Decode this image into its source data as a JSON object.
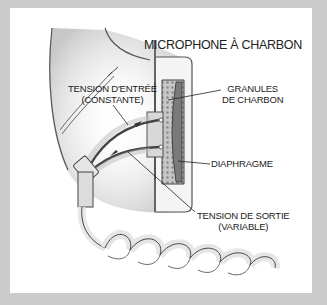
{
  "diagram": {
    "title": "MICROPHONE À CHARBON",
    "labels": {
      "input_voltage": {
        "line1": "TENSION D'ENTRÉE",
        "line2": "(CONSTANTE)"
      },
      "carbon_granules": {
        "line1": "GRANULES",
        "line2": "DE CHARBON"
      },
      "diaphragm": {
        "line1": "DIAPHRAGME"
      },
      "output_voltage": {
        "line1": "TENSION DE SORTIE",
        "line2": "(VARIABLE)"
      }
    },
    "colors": {
      "frame": "#cbcbcb",
      "panel": "#ffffff",
      "ink": "#222222",
      "shading": "#9a9a9a",
      "granules": "#b8b8b8",
      "diaphragm": "#7a7a7a"
    }
  }
}
